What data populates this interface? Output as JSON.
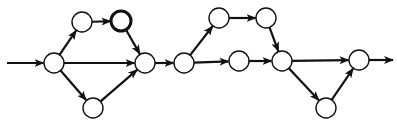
{
  "diagram": {
    "type": "directed-graph",
    "colors": {
      "stroke": "#111111",
      "fill": "#ffffff",
      "background": "#ffffff"
    },
    "node_radius": 10,
    "nodes": [
      {
        "id": "n1",
        "x": 54,
        "y": 63,
        "bold": false
      },
      {
        "id": "n2",
        "x": 82,
        "y": 22,
        "bold": false
      },
      {
        "id": "n3",
        "x": 121,
        "y": 21,
        "bold": true
      },
      {
        "id": "n4",
        "x": 93,
        "y": 108,
        "bold": false
      },
      {
        "id": "n5",
        "x": 145,
        "y": 63,
        "bold": false
      },
      {
        "id": "n6",
        "x": 184,
        "y": 63,
        "bold": false
      },
      {
        "id": "n7",
        "x": 219,
        "y": 18,
        "bold": false
      },
      {
        "id": "n8",
        "x": 266,
        "y": 18,
        "bold": false
      },
      {
        "id": "n9",
        "x": 239,
        "y": 61,
        "bold": false
      },
      {
        "id": "n10",
        "x": 282,
        "y": 61,
        "bold": false
      },
      {
        "id": "n11",
        "x": 326,
        "y": 108,
        "bold": false
      },
      {
        "id": "n12",
        "x": 359,
        "y": 60,
        "bold": false
      }
    ],
    "edges": [
      {
        "from": "n1",
        "to": "n2"
      },
      {
        "from": "n1",
        "to": "n5"
      },
      {
        "from": "n1",
        "to": "n4"
      },
      {
        "from": "n2",
        "to": "n3"
      },
      {
        "from": "n3",
        "to": "n5"
      },
      {
        "from": "n4",
        "to": "n5"
      },
      {
        "from": "n5",
        "to": "n6"
      },
      {
        "from": "n6",
        "to": "n7"
      },
      {
        "from": "n6",
        "to": "n9"
      },
      {
        "from": "n7",
        "to": "n8"
      },
      {
        "from": "n8",
        "to": "n10"
      },
      {
        "from": "n9",
        "to": "n10"
      },
      {
        "from": "n10",
        "to": "n12"
      },
      {
        "from": "n10",
        "to": "n11"
      },
      {
        "from": "n11",
        "to": "n12"
      }
    ],
    "input_arrow": {
      "x1": 7,
      "y1": 63,
      "to": "n1"
    },
    "output_arrow": {
      "from": "n12",
      "x2": 393,
      "y2": 60
    }
  }
}
